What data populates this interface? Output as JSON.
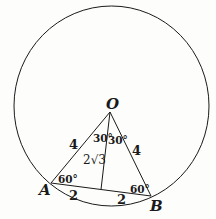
{
  "diagram": {
    "points": {
      "O": "O",
      "A": "A",
      "B": "B"
    },
    "sides": {
      "OA": "4",
      "OB": "4",
      "A_mid": "2",
      "mid_B": "2",
      "altitude": "2√3"
    },
    "angles": {
      "O_left": "30°",
      "O_right": "30°",
      "A": "60°",
      "B": "60°"
    },
    "colors": {
      "stroke": "#1a1a1a",
      "background": "#fdfdfc"
    }
  }
}
